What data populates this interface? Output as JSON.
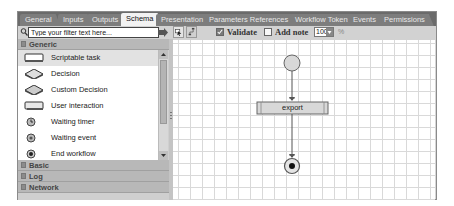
{
  "tabs": [
    {
      "label": "General",
      "active": false
    },
    {
      "label": "Inputs",
      "active": false
    },
    {
      "label": "Outputs",
      "active": false
    },
    {
      "label": "Schema",
      "active": true
    },
    {
      "label": "Presentation",
      "active": false
    },
    {
      "label": "Parameters References",
      "active": false
    },
    {
      "label": "Workflow Tokens",
      "active": false
    },
    {
      "label": "Events",
      "active": false
    },
    {
      "label": "Permissions",
      "active": false
    }
  ],
  "toolbar": {
    "filter_placeholder": "Type your filter text here...",
    "select_tool_icon": "select-icon",
    "connect_tool_icon": "connector-icon",
    "validate_label": "Validate",
    "validate_checked": true,
    "add_note_label": "Add note",
    "add_note_checked": false,
    "zoom_value": "100",
    "zoom_unit": "%"
  },
  "palette": {
    "sections": [
      {
        "label": "Generic",
        "expanded": true
      },
      {
        "label": "Basic",
        "expanded": false
      },
      {
        "label": "Log",
        "expanded": false
      },
      {
        "label": "Network",
        "expanded": false
      }
    ],
    "items": [
      {
        "label": "Scriptable task",
        "icon": "scriptable-task-icon",
        "selected": true
      },
      {
        "label": "Decision",
        "icon": "decision-icon",
        "selected": false
      },
      {
        "label": "Custom Decision",
        "icon": "custom-decision-icon",
        "selected": false
      },
      {
        "label": "User interaction",
        "icon": "user-interaction-icon",
        "selected": false
      },
      {
        "label": "Waiting timer",
        "icon": "waiting-timer-icon",
        "selected": false
      },
      {
        "label": "Waiting event",
        "icon": "waiting-event-icon",
        "selected": false
      },
      {
        "label": "End workflow",
        "icon": "end-workflow-icon",
        "selected": false
      }
    ]
  },
  "canvas": {
    "nodes": [
      {
        "type": "start",
        "label": ""
      },
      {
        "type": "task",
        "label": "export"
      },
      {
        "type": "end",
        "label": ""
      }
    ]
  },
  "colors": {
    "tabbar": "#6b6b6b",
    "active_tab": "#f2f2f2",
    "toolbar": "#d2d2d2",
    "section_header": "#b8b8b8",
    "grid": "#d9d9d9",
    "node_fill": "#d8d8d8"
  }
}
